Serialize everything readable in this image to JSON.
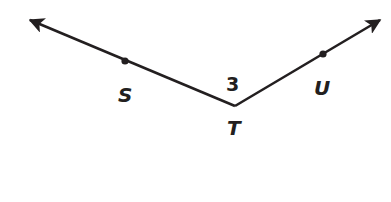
{
  "diagram": {
    "type": "angle",
    "vertex": {
      "label": "T",
      "x": 235,
      "y": 106
    },
    "points": [
      {
        "label": "S",
        "x": 125,
        "y": 61
      },
      {
        "label": "U",
        "x": 323,
        "y": 54
      }
    ],
    "angle_label": "3",
    "rays": [
      {
        "from": "T",
        "through": "S",
        "arrow": true
      },
      {
        "from": "T",
        "through": "U",
        "arrow": true
      }
    ],
    "stroke_color": "#231f20"
  }
}
